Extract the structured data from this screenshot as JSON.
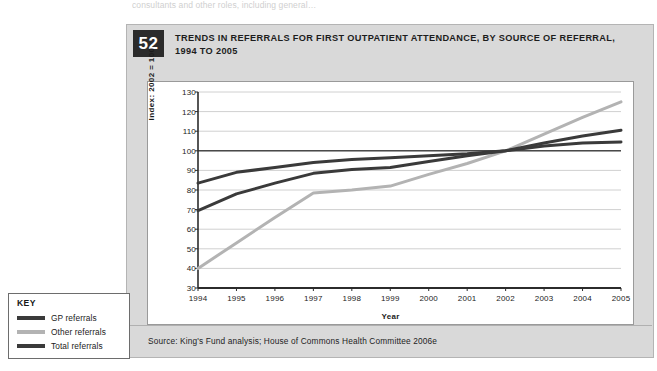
{
  "top_cut_text": "consultants and other roles, including general…",
  "figure": {
    "number": "52",
    "title": "TRENDS IN REFERRALS FOR FIRST OUTPATIENT ATTENDANCE, BY SOURCE OF REFERRAL, 1994 TO 2005",
    "source": "Source: King's Fund analysis; House of Commons Health Committee 2006e"
  },
  "key": {
    "title": "KEY",
    "items": [
      {
        "label": "GP referrals",
        "color": "#3a3a3a"
      },
      {
        "label": "Other referrals",
        "color": "#b3b3b3"
      },
      {
        "label": "Total referrals",
        "color": "#3a3a3a"
      }
    ]
  },
  "chart_data": {
    "type": "line",
    "title": "TRENDS IN REFERRALS FOR FIRST OUTPATIENT ATTENDANCE, BY SOURCE OF REFERRAL, 1994 TO 2005",
    "xlabel": "Year",
    "ylabel": "Index: 2002 = 100",
    "categories": [
      "1994",
      "1995",
      "1996",
      "1997",
      "1998",
      "1999",
      "2000",
      "2001",
      "2002",
      "2003",
      "2004",
      "2005"
    ],
    "x": [
      1994,
      1995,
      1996,
      1997,
      1998,
      1999,
      2000,
      2001,
      2002,
      2003,
      2004,
      2005
    ],
    "xlim": [
      1994,
      2005
    ],
    "ylim": [
      30,
      130
    ],
    "yticks": [
      30,
      40,
      50,
      60,
      70,
      80,
      90,
      100,
      110,
      120,
      130
    ],
    "grid": true,
    "legend_position": "external-key-box-bottom-left",
    "reference_line": {
      "value": 100,
      "label": "Index: 2002 = 100"
    },
    "series": [
      {
        "name": "GP referrals",
        "color": "#3a3a3a",
        "values": [
          69.5,
          78.0,
          83.5,
          88.5,
          90.5,
          91.5,
          94.5,
          97.5,
          100.0,
          104.0,
          107.5,
          110.5
        ]
      },
      {
        "name": "Other referrals",
        "color": "#b3b3b3",
        "values": [
          40.0,
          53.0,
          66.0,
          78.5,
          80.0,
          82.0,
          88.0,
          93.5,
          100.0,
          108.5,
          117.0,
          125.0
        ]
      },
      {
        "name": "Total referrals",
        "color": "#3a3a3a",
        "values": [
          83.5,
          89.0,
          91.5,
          94.0,
          95.5,
          96.5,
          97.5,
          98.5,
          100.0,
          102.5,
          104.0,
          104.5
        ]
      }
    ]
  },
  "colors": {
    "panel_background": "#d9d9d9",
    "badge_background": "#2b2b2b",
    "plot_background": "#ffffff",
    "gridline": "#d0d0d0",
    "axis": "#2b2b2b"
  }
}
